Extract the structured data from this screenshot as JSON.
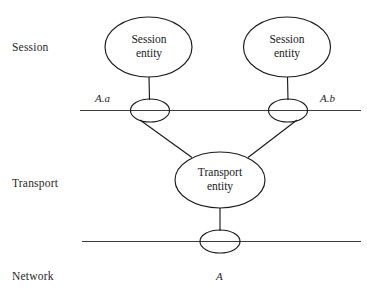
{
  "diagram": {
    "layers": [
      {
        "id": "session",
        "label": "Session"
      },
      {
        "id": "transport",
        "label": "Transport"
      },
      {
        "id": "network",
        "label": "Network"
      }
    ],
    "nodes": {
      "session_entity_left": {
        "line1": "Session",
        "line2": "entity"
      },
      "session_entity_right": {
        "line1": "Session",
        "line2": "entity"
      },
      "transport_entity": {
        "line1": "Transport",
        "line2": "entity"
      }
    },
    "access_points": [
      {
        "id": "sap-left",
        "label": "A.a"
      },
      {
        "id": "sap-right",
        "label": "A.b"
      },
      {
        "id": "network-sap",
        "label": "A"
      }
    ],
    "colors": {
      "stroke": "#1a1a1a",
      "bus_line": "#3c3c3c",
      "background": "#ffffff",
      "text": "#262626"
    }
  }
}
